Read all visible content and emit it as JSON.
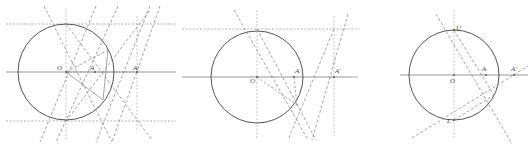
{
  "figure": {
    "title": "",
    "panel_count": 3,
    "width": 528,
    "height": 148,
    "background": "#ffffff",
    "stroke_solid": "#555555",
    "stroke_dashed": "#777777",
    "stroke_light": "#999999",
    "label_color": "#4a4a4a"
  },
  "panels": [
    {
      "id": "panel-1",
      "name": "inversion-construction-point-inside",
      "circle": {
        "cx": 66,
        "cy": 72,
        "r": 48
      },
      "labels": [
        {
          "text": "O",
          "x": 59,
          "y": 70,
          "name": "label-center-O"
        },
        {
          "text": "A",
          "x": 92,
          "y": 70,
          "name": "label-point-A"
        },
        {
          "text": "A'",
          "x": 135,
          "y": 70,
          "name": "label-point-A-prime"
        }
      ],
      "axis": {
        "y": 72,
        "x1": 6,
        "x2": 176
      },
      "horizontal_dashed": [
        24,
        121
      ],
      "vertical_dashed": [
        66,
        137
      ],
      "points": {
        "A": {
          "x": 95,
          "y": 72
        },
        "A_prime": {
          "x": 137,
          "y": 72
        },
        "top_tangent": {
          "x": 66,
          "y": 24
        },
        "bottom_tangent": {
          "x": 66,
          "y": 121
        },
        "upper_right": {
          "x": 108,
          "y": 50
        },
        "lower_right": {
          "x": 103,
          "y": 100
        }
      }
    },
    {
      "id": "panel-2",
      "name": "inversion-construction-tangent-chord",
      "circle": {
        "cx": 257,
        "cy": 77,
        "r": 46
      },
      "labels": [
        {
          "text": "O",
          "x": 250,
          "y": 82,
          "name": "label-center-O"
        },
        {
          "text": "A",
          "x": 296,
          "y": 72,
          "name": "label-point-A"
        },
        {
          "text": "A'",
          "x": 336,
          "y": 72,
          "name": "label-point-A-prime"
        }
      ],
      "axis": {
        "y": 77,
        "x1": 182,
        "x2": 352
      },
      "horizontal_dashed": [
        29
      ],
      "vertical_dashed": [
        257,
        334
      ],
      "points": {
        "A": {
          "x": 294,
          "y": 77
        },
        "A_prime": {
          "x": 334,
          "y": 77
        },
        "top_tangent": {
          "x": 257,
          "y": 29
        },
        "intersection": {
          "x": 297,
          "y": 105
        }
      }
    },
    {
      "id": "panel-3",
      "name": "inversion-construction-chord-UL",
      "circle": {
        "cx": 454,
        "cy": 75,
        "r": 45
      },
      "labels": [
        {
          "text": "O",
          "x": 452,
          "y": 82,
          "name": "label-center-O"
        },
        {
          "text": "A",
          "x": 483,
          "y": 71,
          "name": "label-point-A"
        },
        {
          "text": "A'",
          "x": 512,
          "y": 71,
          "name": "label-point-A-prime"
        },
        {
          "text": "U",
          "x": 457,
          "y": 36,
          "name": "label-point-U"
        },
        {
          "text": "L",
          "x": 448,
          "y": 122,
          "name": "label-point-L"
        }
      ],
      "axis": {
        "y": 75,
        "x1": 400,
        "x2": 528
      },
      "horizontal_dashed": [],
      "vertical_dashed": [
        454
      ],
      "points": {
        "A": {
          "x": 486,
          "y": 75
        },
        "A_prime": {
          "x": 514,
          "y": 75
        },
        "U": {
          "x": 454,
          "y": 30
        },
        "L": {
          "x": 454,
          "y": 120
        },
        "intersection": {
          "x": 494,
          "y": 95
        }
      },
      "edge_stubs": [
        {
          "x1": 352,
          "y1": 29,
          "x2": 360,
          "y2": 29,
          "name": "edge-stub-top"
        },
        {
          "x1": 352,
          "y1": 77,
          "x2": 358,
          "y2": 77,
          "name": "edge-stub-middle"
        }
      ]
    }
  ]
}
